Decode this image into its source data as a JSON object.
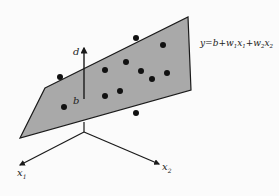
{
  "diagram": {
    "equation": {
      "y": "y",
      "eq": "=",
      "b": "b",
      "plus1": "+",
      "w1": "w",
      "w1_sub": "1",
      "x1": "x",
      "x1_sub": "1",
      "plus2": "+",
      "w2": "w",
      "w2_sub": "2",
      "x2": "x",
      "x2_sub": "2"
    },
    "labels": {
      "d": "d",
      "b": "b",
      "axis_x1": "x",
      "axis_x1_sub": "1",
      "axis_x2": "x",
      "axis_x2_sub": "2"
    },
    "colors": {
      "plane_fill": "#a9a9a9",
      "stroke": "#1a1a1a",
      "point": "#111111",
      "background": "#fbfbfb"
    },
    "plane": [
      [
        45,
        88
      ],
      [
        188,
        17
      ],
      [
        191,
        90
      ],
      [
        20,
        138
      ]
    ],
    "points": [
      [
        60,
        77
      ],
      [
        136,
        38
      ],
      [
        163,
        45
      ],
      [
        105,
        70
      ],
      [
        126,
        62
      ],
      [
        141,
        71
      ],
      [
        152,
        79
      ],
      [
        167,
        73
      ],
      [
        105,
        96
      ],
      [
        120,
        91
      ],
      [
        64,
        107
      ],
      [
        136,
        113
      ]
    ]
  }
}
